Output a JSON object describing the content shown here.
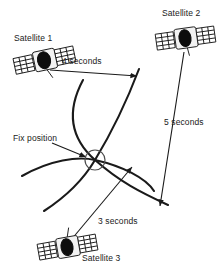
{
  "figure": {
    "type": "diagram",
    "background_color": "#ffffff",
    "stroke_color": "#1a1a1a"
  },
  "labels": {
    "satellite_1": "Satellite 1",
    "satellite_2": "Satellite 2",
    "satellite_3": "Satellite 3",
    "fix_position": "Fix position",
    "distance_1": "4 seconds",
    "distance_2": "5 seconds",
    "distance_3": "3 seconds"
  },
  "satellites": [
    {
      "name": "Satellite 1",
      "travel_time": "4 seconds",
      "x": 45,
      "y": 60,
      "rotation": -12
    },
    {
      "name": "Satellite 2",
      "travel_time": "5 seconds",
      "x": 186,
      "y": 38,
      "rotation": -8
    },
    {
      "name": "Satellite 3",
      "travel_time": "3 seconds",
      "x": 68,
      "y": 247,
      "rotation": -10
    }
  ],
  "fix_position_marker": {
    "x": 95,
    "y": 160,
    "radius": 10
  },
  "icons": {
    "satellite": "satellite-icon",
    "fix_marker": "fix-position-circle-icon",
    "arrow": "arrow-icon"
  }
}
